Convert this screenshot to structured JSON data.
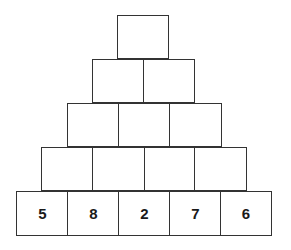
{
  "pyramid": {
    "title": "",
    "rows": [
      {
        "cells": [
          ""
        ]
      },
      {
        "cells": [
          "",
          ""
        ]
      },
      {
        "cells": [
          "",
          "",
          ""
        ]
      },
      {
        "cells": [
          "",
          "",
          "",
          ""
        ]
      },
      {
        "cells": [
          "5",
          "8",
          "2",
          "7",
          "6"
        ]
      }
    ],
    "border_color": "#333333",
    "text_color": "#1a1a1a"
  }
}
